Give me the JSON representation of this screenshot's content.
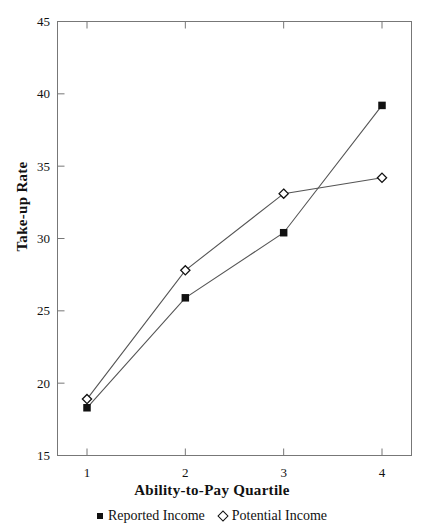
{
  "chart_data": {
    "type": "line",
    "title": "",
    "xlabel": "Ability-to-Pay Quartile",
    "ylabel": "Take-up Rate",
    "categories": [
      "1",
      "2",
      "3",
      "4"
    ],
    "x": [
      1,
      2,
      3,
      4
    ],
    "xlim": [
      0.7,
      4.3
    ],
    "ylim": [
      15,
      45
    ],
    "xticks": [
      "1",
      "2",
      "3",
      "4"
    ],
    "yticks": [
      "15",
      "20",
      "25",
      "30",
      "35",
      "40",
      "45"
    ],
    "grid": false,
    "legend_position": "bottom-center",
    "series": [
      {
        "name": "Reported Income",
        "marker": "filled-square",
        "color": "#111111",
        "values": [
          18.3,
          25.9,
          30.4,
          39.2
        ]
      },
      {
        "name": "Potential Income",
        "marker": "open-diamond",
        "color": "#111111",
        "values": [
          18.9,
          27.8,
          33.1,
          34.2
        ]
      }
    ]
  },
  "axes": {
    "y_title": "Take-up Rate",
    "x_title": "Ability-to-Pay Quartile"
  },
  "legend": {
    "items": [
      {
        "label": "Reported Income",
        "marker": "filled-square-icon"
      },
      {
        "label": "Potential Income",
        "marker": "open-diamond-icon"
      }
    ]
  },
  "colors": {
    "line": "#555555",
    "marker": "#111111",
    "axis": "#666666",
    "background": "#ffffff"
  }
}
